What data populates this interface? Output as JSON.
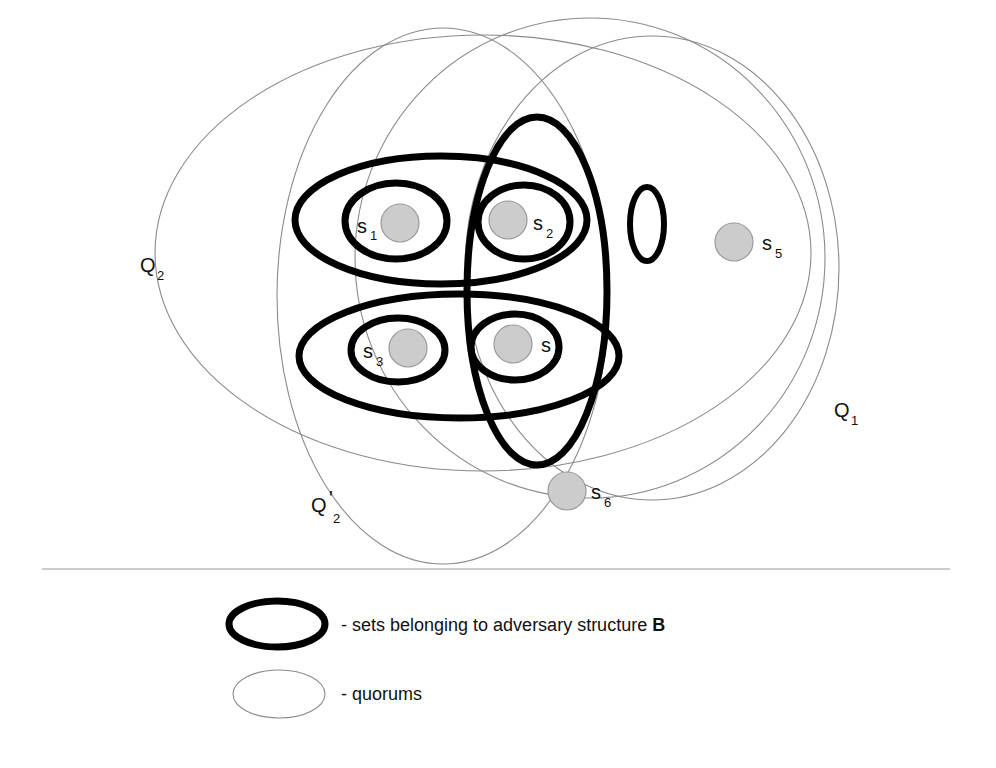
{
  "diagram": {
    "quorums": [
      {
        "id": "Q1",
        "label": "Q",
        "sub": "1",
        "prime": ""
      },
      {
        "id": "Q2",
        "label": "Q",
        "sub": "2",
        "prime": ""
      },
      {
        "id": "Q2p",
        "label": "Q",
        "sub": "2",
        "prime": "'"
      },
      {
        "id": "Q0",
        "label": "",
        "sub": "",
        "prime": ""
      }
    ],
    "servers": [
      {
        "id": "s1",
        "label": "s",
        "sub": "1"
      },
      {
        "id": "s2",
        "label": "s",
        "sub": "2"
      },
      {
        "id": "s3",
        "label": "s",
        "sub": "3"
      },
      {
        "id": "s4",
        "label": "s",
        "sub": "4"
      },
      {
        "id": "s5",
        "label": "s",
        "sub": "5"
      },
      {
        "id": "s6",
        "label": "s",
        "sub": "6"
      }
    ],
    "colors": {
      "server_fill": "#cccccc",
      "server_stroke": "#9a9a9a",
      "quorum_stroke": "#8a8a8a",
      "adversary_stroke": "#000000",
      "divider": "#9a9a9a"
    }
  },
  "legend": {
    "adversary_prefix": "- sets belonging to adversary structure ",
    "adversary_bold": "B",
    "quorum_text": "- quorums"
  }
}
